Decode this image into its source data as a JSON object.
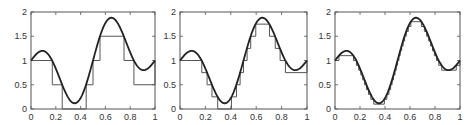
{
  "figure": {
    "panel_count": 3,
    "colors": {
      "axes": "#555555",
      "curve": "#222222",
      "steps": "#555555",
      "background": "#ffffff"
    }
  },
  "chart_data": [
    {
      "type": "line",
      "title": "",
      "xlabel": "",
      "ylabel": "",
      "xlim": [
        0,
        1
      ],
      "ylim": [
        0,
        2
      ],
      "xticks": [
        0,
        0.2,
        0.4,
        0.6,
        0.8,
        1
      ],
      "xtick_labels": [
        "0",
        "0.2",
        "0.4",
        "0.6",
        "0.8",
        "1"
      ],
      "yticks": [
        0,
        0.5,
        1,
        1.5,
        2
      ],
      "ytick_labels": [
        "0",
        "0.5",
        "1",
        "1.5",
        "2"
      ],
      "grid": false,
      "quantization_step": 0.5,
      "series": [
        {
          "name": "smooth curve",
          "style": "thick-line",
          "x": [
            0,
            0.09,
            0.35,
            0.65,
            0.91,
            1
          ],
          "y": [
            1.0,
            1.2,
            0.12,
            1.88,
            0.8,
            1.0
          ]
        },
        {
          "name": "quantized step approximation",
          "style": "stairs",
          "edges": [
            0,
            0.167,
            0.25,
            0.444,
            0.5,
            0.556,
            0.75,
            0.833,
            1
          ],
          "levels": [
            1.0,
            0.5,
            0.0,
            0.5,
            1.0,
            1.5,
            1.0,
            0.5
          ]
        }
      ]
    },
    {
      "type": "line",
      "title": "",
      "xlabel": "",
      "ylabel": "",
      "xlim": [
        0,
        1
      ],
      "ylim": [
        0,
        2
      ],
      "xticks": [
        0,
        0.2,
        0.4,
        0.6,
        0.8,
        1
      ],
      "xtick_labels": [
        "0",
        "0.2",
        "0.4",
        "0.6",
        "0.8",
        "1"
      ],
      "yticks": [
        0,
        0.5,
        1,
        1.5,
        2
      ],
      "ytick_labels": [
        "0",
        "0.5",
        "1",
        "1.5",
        "2"
      ],
      "grid": false,
      "quantization_step": 0.25,
      "series": [
        {
          "name": "smooth curve",
          "style": "thick-line",
          "x": [
            0,
            0.09,
            0.35,
            0.65,
            0.91,
            1
          ],
          "y": [
            1.0,
            1.2,
            0.12,
            1.88,
            0.8,
            1.0
          ]
        },
        {
          "name": "quantized step approximation",
          "style": "stairs",
          "levels_rule": "floor to nearest 0.25"
        }
      ]
    },
    {
      "type": "line",
      "title": "",
      "xlabel": "",
      "ylabel": "",
      "xlim": [
        0,
        1
      ],
      "ylim": [
        0,
        2
      ],
      "xticks": [
        0,
        0.2,
        0.4,
        0.6,
        0.8,
        1
      ],
      "xtick_labels": [
        "0",
        "0.2",
        "0.4",
        "0.6",
        "0.8",
        "1"
      ],
      "yticks": [
        0,
        0.5,
        1,
        1.5,
        2
      ],
      "ytick_labels": [
        "0",
        "0.5",
        "1",
        "1.5",
        "2"
      ],
      "grid": false,
      "quantization_step": 0.1,
      "series": [
        {
          "name": "smooth curve",
          "style": "thick-line",
          "x": [
            0,
            0.09,
            0.35,
            0.65,
            0.91,
            1
          ],
          "y": [
            1.0,
            1.2,
            0.12,
            1.88,
            0.8,
            1.0
          ]
        },
        {
          "name": "quantized step approximation",
          "style": "stairs",
          "levels_rule": "floor to nearest 0.1"
        }
      ]
    }
  ],
  "layout": {
    "panels": [
      {
        "left": 31,
        "top": 12,
        "right": 155,
        "bottom": 109
      },
      {
        "left": 180,
        "top": 12,
        "right": 307,
        "bottom": 109
      },
      {
        "left": 335,
        "top": 12,
        "right": 460,
        "bottom": 109
      }
    ]
  }
}
